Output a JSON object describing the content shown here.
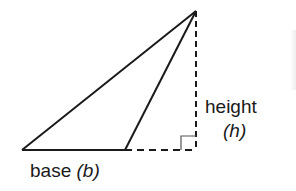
{
  "diagram": {
    "type": "triangle-area-obtuse",
    "colors": {
      "stroke": "#1a1a1a",
      "background": "#ffffff"
    },
    "vertices": {
      "apex": [
        196,
        11
      ],
      "base_left": [
        22,
        150
      ],
      "base_right": [
        125,
        150
      ],
      "foot_of_height": [
        196,
        150
      ]
    },
    "right_angle_marker": {
      "corner": [
        196,
        150
      ],
      "size": 14
    },
    "labels": {
      "base": {
        "word": "base",
        "variable": "(b)"
      },
      "height": {
        "word": "height",
        "variable": "(h)"
      }
    }
  }
}
